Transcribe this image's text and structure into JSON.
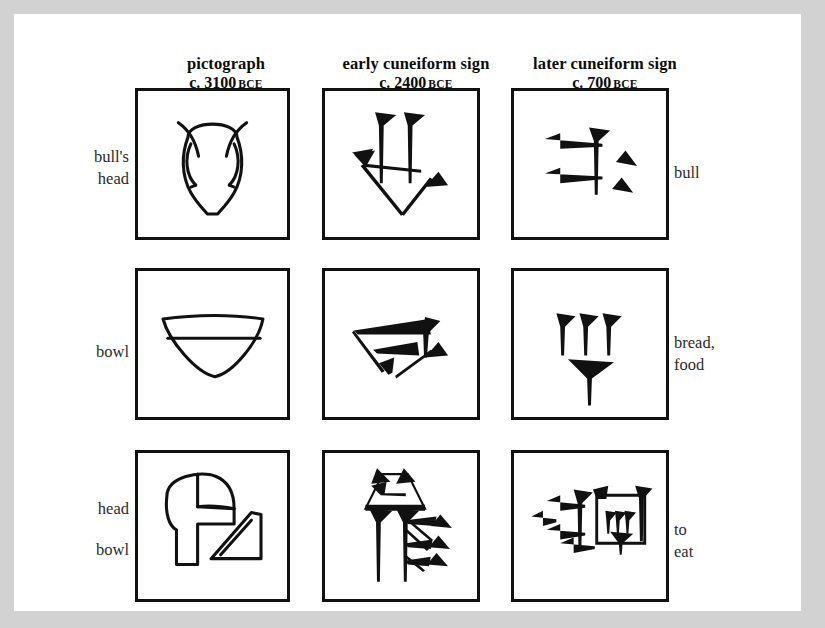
{
  "page": {
    "background_color": "#d2d2d2",
    "paper_color": "#ffffff",
    "ink_color": "#111111"
  },
  "columns": [
    {
      "name": "pictograph",
      "date": "c. 3100",
      "era": "BCE"
    },
    {
      "name": "early cuneiform sign",
      "date": "c. 2400",
      "era": "BCE"
    },
    {
      "name": "later cuneiform sign",
      "date": "c. 700",
      "era": "BCE"
    }
  ],
  "rows": [
    {
      "left_label_line1": "bull's",
      "left_label_line2": "head",
      "right_label_line1": "bull",
      "right_label_line2": "",
      "cells": [
        {
          "sign": "bull-head-pictograph"
        },
        {
          "sign": "bull-early-cuneiform"
        },
        {
          "sign": "bull-later-cuneiform"
        }
      ]
    },
    {
      "left_label_line1": "bowl",
      "left_label_line2": "",
      "right_label_line1": "bread,",
      "right_label_line2": "food",
      "cells": [
        {
          "sign": "bowl-pictograph"
        },
        {
          "sign": "bread-early-cuneiform"
        },
        {
          "sign": "bread-later-cuneiform"
        }
      ]
    },
    {
      "left_label_line1": "head",
      "left_label_line2": "bowl",
      "right_label_line1": "to",
      "right_label_line2": "eat",
      "cells": [
        {
          "sign": "head-plus-bowl-pictograph"
        },
        {
          "sign": "to-eat-early-cuneiform"
        },
        {
          "sign": "to-eat-later-cuneiform"
        }
      ]
    }
  ]
}
